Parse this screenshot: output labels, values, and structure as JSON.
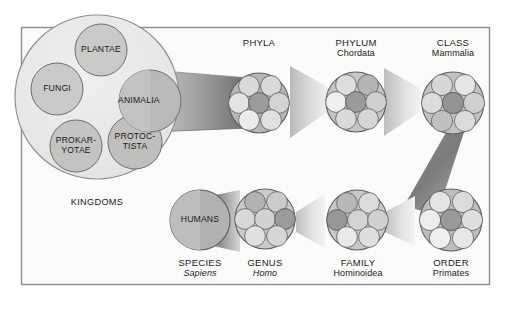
{
  "diagram": {
    "frame": {
      "border_color": "#8d8d8d",
      "background": "#fbfbfa"
    },
    "colors": {
      "page_background": "#ffffff",
      "circle_fill_light": "#dcdcda",
      "circle_fill_mid": "#c6c6c4",
      "circle_fill_dark": "#9d9d9b",
      "cone_dark": "#6f6f6d",
      "cone_light": "#e6e6e4",
      "outline": "#6a6a68",
      "text": "#1a1a1a"
    },
    "kingdoms_group": {
      "caption": "KINGDOMS",
      "items": [
        {
          "label": "PLANTAE",
          "shade": "mid"
        },
        {
          "label": "FUNGI",
          "shade": "mid"
        },
        {
          "label": "ANIMALIA",
          "shade": "dark",
          "expands_to": "PHYLA"
        },
        {
          "label": "PROKAR-\nYOTAE",
          "line1": "PROKAR-",
          "line2": "YOTAE",
          "shade": "mid"
        },
        {
          "label": "PROTOC-\nTISTA",
          "line1": "PROTOC-",
          "line2": "TISTA",
          "shade": "mid"
        }
      ]
    },
    "ranks": [
      {
        "id": "phyla",
        "rank": "PHYLA",
        "taxon": "",
        "italic": false,
        "row": "top",
        "member_count": 7,
        "highlighted_index": 3,
        "source": "ANIMALIA"
      },
      {
        "id": "phylum",
        "rank": "PHYLUM",
        "taxon": "Chordata",
        "italic": false,
        "row": "top",
        "member_count": 7,
        "highlighted_index": 3,
        "source": "PHYLA"
      },
      {
        "id": "class",
        "rank": "CLASS",
        "taxon": "Mammalia",
        "italic": false,
        "row": "top",
        "member_count": 7,
        "highlighted_index": 3,
        "source": "PHYLUM"
      },
      {
        "id": "order",
        "rank": "ORDER",
        "taxon": "Primates",
        "italic": false,
        "row": "bottom",
        "member_count": 7,
        "highlighted_index": 3,
        "source": "CLASS"
      },
      {
        "id": "family",
        "rank": "FAMILY",
        "taxon": "Hominoidea",
        "italic": false,
        "row": "bottom",
        "member_count": 7,
        "highlighted_index": 2,
        "source": "ORDER"
      },
      {
        "id": "genus",
        "rank": "GENUS",
        "taxon": "Homo",
        "italic": true,
        "row": "bottom",
        "member_count": 7,
        "highlighted_index": 4,
        "source": "FAMILY"
      },
      {
        "id": "species",
        "rank": "SPECIES",
        "taxon": "Sapiens",
        "italic": true,
        "row": "bottom",
        "member_count": 1,
        "highlighted_index": 0,
        "source": "GENUS",
        "single_label": "HUMANS"
      }
    ],
    "single_circle_label": "HUMANS"
  }
}
